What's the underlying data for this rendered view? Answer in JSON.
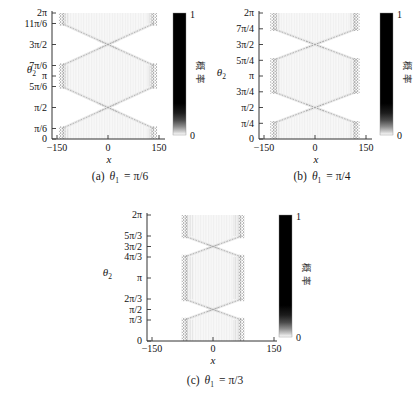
{
  "chart_data": {
    "type": "heatmap",
    "plots": [
      {
        "caption": {
          "index": "(a)",
          "var": "θ",
          "sub": "1",
          "eq": "= π/6"
        },
        "theta1_over_pi": 0.16667,
        "front_half_width_x": 135,
        "xlabel": "x",
        "ylabel": "θ",
        "ylabel_sub": "2",
        "x_range": [
          -150,
          150
        ],
        "y_range_over_pi": [
          0,
          2
        ],
        "pinch_points_over_pi": [
          0.5,
          1.5
        ],
        "xticks": [
          {
            "v": -150,
            "label": "−150"
          },
          {
            "v": 0,
            "label": "0"
          },
          {
            "v": 150,
            "label": "150"
          }
        ],
        "yticks": [
          {
            "v": 0,
            "label": "0"
          },
          {
            "v": 0.16667,
            "label": "π/6"
          },
          {
            "v": 0.5,
            "label": "π/2"
          },
          {
            "v": 0.83333,
            "label": "5π/6"
          },
          {
            "v": 1,
            "label": "π"
          },
          {
            "v": 1.16667,
            "label": "7π/6"
          },
          {
            "v": 1.5,
            "label": "3π/2"
          },
          {
            "v": 1.83333,
            "label": "11π/6"
          },
          {
            "v": 2,
            "label": "2π"
          }
        ],
        "colorbar": {
          "top": "1",
          "bottom": "0",
          "label": "概率",
          "max_color": "#000000",
          "min_color": "#ffffff"
        }
      },
      {
        "caption": {
          "index": "(b)",
          "var": "θ",
          "sub": "1",
          "eq": "= π/4"
        },
        "theta1_over_pi": 0.25,
        "front_half_width_x": 122,
        "xlabel": "x",
        "ylabel": "θ",
        "ylabel_sub": "2",
        "x_range": [
          -150,
          150
        ],
        "y_range_over_pi": [
          0,
          2
        ],
        "pinch_points_over_pi": [
          0.5,
          1.5
        ],
        "xticks": [
          {
            "v": -150,
            "label": "−150"
          },
          {
            "v": 0,
            "label": "0"
          },
          {
            "v": 150,
            "label": "150"
          }
        ],
        "yticks": [
          {
            "v": 0,
            "label": "0"
          },
          {
            "v": 0.25,
            "label": "π/4"
          },
          {
            "v": 0.5,
            "label": "π/2"
          },
          {
            "v": 0.75,
            "label": "3π/4"
          },
          {
            "v": 1,
            "label": "π"
          },
          {
            "v": 1.25,
            "label": "5π/4"
          },
          {
            "v": 1.5,
            "label": "3π/2"
          },
          {
            "v": 1.75,
            "label": "7π/4"
          },
          {
            "v": 2,
            "label": "2π"
          }
        ],
        "colorbar": {
          "top": "1",
          "bottom": "0",
          "label": "概率",
          "max_color": "#000000",
          "min_color": "#ffffff"
        }
      },
      {
        "caption": {
          "index": "(c)",
          "var": "θ",
          "sub": "1",
          "eq": "= π/3"
        },
        "theta1_over_pi": 0.33333,
        "front_half_width_x": 70,
        "xlabel": "x",
        "ylabel": "θ",
        "ylabel_sub": "2",
        "x_range": [
          -150,
          150
        ],
        "y_range_over_pi": [
          0,
          2
        ],
        "pinch_points_over_pi": [
          0.5,
          1.5
        ],
        "xticks": [
          {
            "v": -150,
            "label": "−150"
          },
          {
            "v": 0,
            "label": "0"
          },
          {
            "v": 150,
            "label": "150"
          }
        ],
        "yticks": [
          {
            "v": 0,
            "label": "0"
          },
          {
            "v": 0.33333,
            "label": "π/3"
          },
          {
            "v": 0.5,
            "label": "π/2"
          },
          {
            "v": 0.66667,
            "label": "2π/3"
          },
          {
            "v": 1,
            "label": "π"
          },
          {
            "v": 1.33333,
            "label": "4π/3"
          },
          {
            "v": 1.5,
            "label": "3π/2"
          },
          {
            "v": 1.66667,
            "label": "5π/3"
          },
          {
            "v": 2,
            "label": "2π"
          }
        ],
        "colorbar": {
          "top": "1",
          "bottom": "0",
          "label": "概率",
          "max_color": "#000000",
          "min_color": "#ffffff"
        }
      }
    ]
  }
}
